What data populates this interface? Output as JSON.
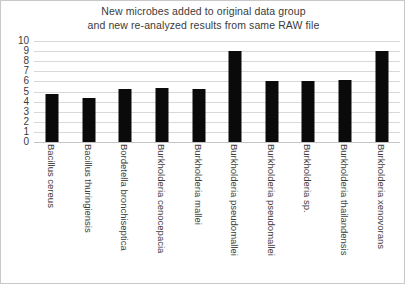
{
  "chart_data": {
    "type": "bar",
    "title": "New microbes added to original data group and new re-analyzed results from same RAW file",
    "title_lines": [
      "New microbes added to original data group",
      "and new re-analyzed results from same RAW file"
    ],
    "xlabel": "",
    "ylabel": "",
    "ylim": [
      0,
      10
    ],
    "yticks": [
      0,
      1,
      2,
      3,
      4,
      5,
      6,
      7,
      8,
      9,
      10
    ],
    "ytick_labels": [
      "0",
      "1",
      "2",
      "3",
      "4",
      "5",
      "6",
      "7",
      "8",
      "9",
      "10"
    ],
    "grid": true,
    "legend": false,
    "bar_color": "#0a0a0a",
    "categories": [
      "Bacillus cereus",
      "Bacillus thuringiensis",
      "Bordetella bronchiseptica",
      "Burkholderia cenocepacia",
      "Burkholderia mallei",
      "Burkholderia pseudomallei",
      "Burkholderia pseudomallei",
      "Burkholderia sp.",
      "Burkholderia thailandensis",
      "Burkholderia xenovorans"
    ],
    "values": [
      4.8,
      4.4,
      5.2,
      5.3,
      5.2,
      9.0,
      6.0,
      6.0,
      6.1,
      9.0
    ]
  }
}
